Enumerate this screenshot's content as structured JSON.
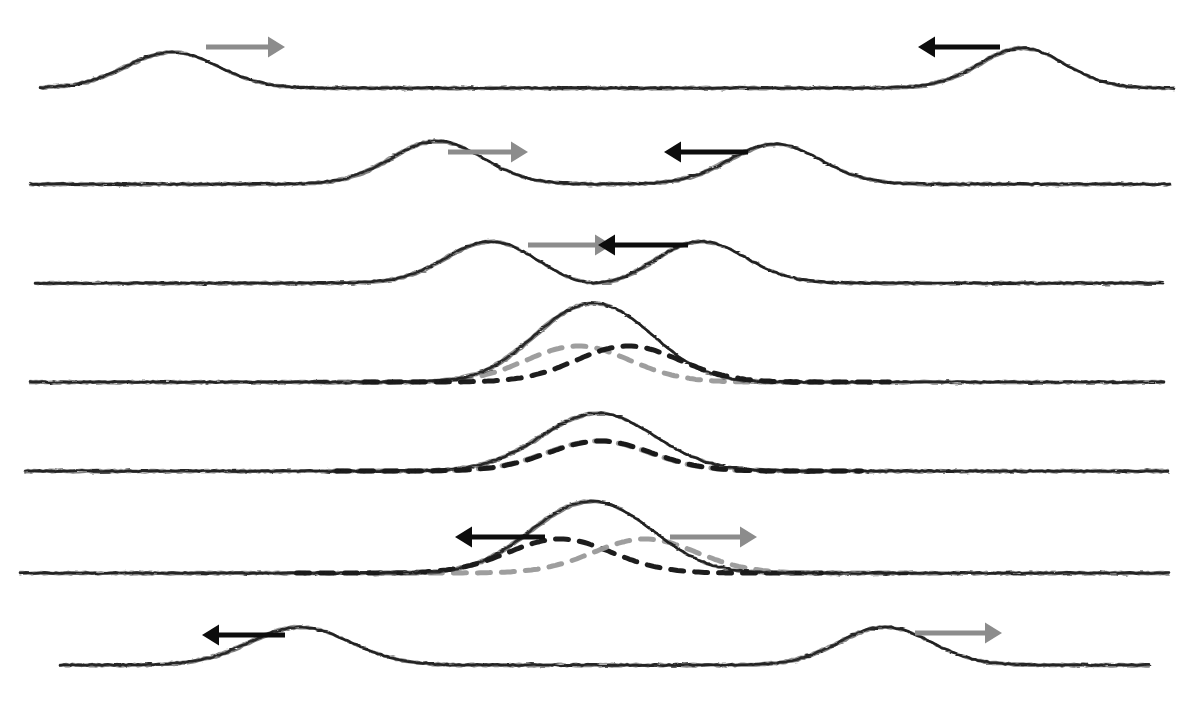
{
  "figure": {
    "title": "Superposition of two wave pulses travelling in opposite directions",
    "subtitle": "",
    "medium": "hand-drawn pencil sketch, photocopied",
    "width": 1191,
    "height": 701,
    "background_color": "#ffffff",
    "rows": 7
  },
  "style": {
    "solid_pulse_color": "#1c1c1c",
    "solid_pulse_width": 2.6,
    "baseline_color": "#2a2a2a",
    "baseline_width": 2.2,
    "dashed_gray_color": "#9a9a9a",
    "dashed_black_color": "#141414",
    "dashed_width": 5.0,
    "dash_pattern": "13 11",
    "arrow_gray_color": "#8c8c8c",
    "arrow_black_color": "#0d0d0d",
    "arrow_shaft_width": 5.0,
    "sketch_jitter": "rough double-stroke"
  },
  "chart_data": {
    "type": "line",
    "title": "Superposition of two wave pulses travelling in opposite directions",
    "subtitle": "",
    "xlabel": "",
    "ylabel": "",
    "xlim": [
      0,
      1191
    ],
    "ylim": [
      0,
      701
    ],
    "grid": false,
    "legend": null,
    "axes_visible": false,
    "panels": [
      {
        "index": 1,
        "label": "pulses far apart, approaching",
        "baseline_y": 88,
        "x_start": 40,
        "x_end": 1175,
        "pulses": [
          {
            "name": "right-moving-pulse",
            "style": "solid",
            "color": "#1c1c1c",
            "center_x": 172,
            "amplitude": 36,
            "width": 150,
            "direction": "right"
          },
          {
            "name": "left-moving-pulse",
            "style": "solid",
            "color": "#1c1c1c",
            "center_x": 1022,
            "amplitude": 40,
            "width": 140,
            "direction": "left"
          }
        ],
        "arrows": [
          {
            "name": "grey-right-arrow",
            "color": "#8c8c8c",
            "direction": "right",
            "x1": 206,
            "x2": 285,
            "y": 47
          },
          {
            "name": "black-left-arrow",
            "color": "#0d0d0d",
            "direction": "left",
            "x1": 1000,
            "x2": 918,
            "y": 47
          }
        ]
      },
      {
        "index": 2,
        "label": "pulses closer together",
        "baseline_y": 184,
        "x_start": 30,
        "x_end": 1170,
        "pulses": [
          {
            "name": "right-moving-pulse",
            "style": "solid",
            "color": "#1c1c1c",
            "center_x": 437,
            "amplitude": 43,
            "width": 150,
            "direction": "right"
          },
          {
            "name": "left-moving-pulse",
            "style": "solid",
            "color": "#1c1c1c",
            "center_x": 775,
            "amplitude": 40,
            "width": 150,
            "direction": "left"
          }
        ],
        "arrows": [
          {
            "name": "grey-right-arrow",
            "color": "#8c8c8c",
            "direction": "right",
            "x1": 448,
            "x2": 528,
            "y": 152
          },
          {
            "name": "black-left-arrow",
            "color": "#0d0d0d",
            "direction": "left",
            "x1": 748,
            "x2": 664,
            "y": 152
          }
        ]
      },
      {
        "index": 3,
        "label": "pulses just touching, small overlap",
        "baseline_y": 283,
        "x_start": 35,
        "x_end": 1165,
        "pulses": [
          {
            "name": "right-moving-pulse",
            "style": "solid",
            "color": "#1c1c1c",
            "center_x": 492,
            "amplitude": 42,
            "width": 150,
            "direction": "right"
          },
          {
            "name": "left-moving-pulse",
            "style": "solid",
            "color": "#1c1c1c",
            "center_x": 700,
            "amplitude": 42,
            "width": 150,
            "direction": "left"
          }
        ],
        "dip": {
          "name": "central-dip",
          "x": 596,
          "depth": 6
        },
        "arrows": [
          {
            "name": "grey-right-arrow",
            "color": "#8c8c8c",
            "direction": "right",
            "x1": 528,
            "x2": 612,
            "y": 245
          },
          {
            "name": "black-left-arrow",
            "color": "#0d0d0d",
            "direction": "left",
            "x1": 688,
            "x2": 598,
            "y": 245
          }
        ]
      },
      {
        "index": 4,
        "label": "partial overlap, constructive build-up",
        "baseline_y": 382,
        "x_start": 30,
        "x_end": 1165,
        "resultant": {
          "name": "resultant-pulse",
          "style": "solid",
          "color": "#1c1c1c",
          "center_x": 592,
          "amplitude": 58,
          "width": 200,
          "notch": true
        },
        "components": [
          {
            "name": "grey-component-pulse",
            "style": "dashed",
            "color": "#9a9a9a",
            "center_x": 578,
            "amplitude": 36,
            "width": 170,
            "direction": "right"
          },
          {
            "name": "black-component-pulse",
            "style": "dashed",
            "color": "#141414",
            "center_x": 628,
            "amplitude": 36,
            "width": 170,
            "direction": "left"
          }
        ],
        "arrows": []
      },
      {
        "index": 5,
        "label": "maximum overlap, pulses coincide",
        "baseline_y": 471,
        "x_start": 25,
        "x_end": 1170,
        "resultant": {
          "name": "resultant-pulse",
          "style": "solid",
          "color": "#1c1c1c",
          "center_x": 598,
          "amplitude": 58,
          "width": 185,
          "notch": false
        },
        "components": [
          {
            "name": "grey-component-pulse",
            "style": "dashed",
            "color": "#9a9a9a",
            "center_x": 598,
            "amplitude": 30,
            "width": 170,
            "direction": "right"
          },
          {
            "name": "black-component-pulse",
            "style": "dashed",
            "color": "#141414",
            "center_x": 600,
            "amplitude": 30,
            "width": 170,
            "direction": "left"
          }
        ],
        "arrows": []
      },
      {
        "index": 6,
        "label": "pulses separating, moving apart",
        "baseline_y": 573,
        "x_start": 20,
        "x_end": 1170,
        "resultant": {
          "name": "resultant-pulse",
          "style": "solid",
          "color": "#1c1c1c",
          "center_x": 590,
          "amplitude": 52,
          "width": 210,
          "notch": true
        },
        "components": [
          {
            "name": "black-component-pulse",
            "style": "dashed",
            "color": "#141414",
            "center_x": 560,
            "amplitude": 34,
            "width": 170,
            "direction": "left"
          },
          {
            "name": "grey-component-pulse",
            "style": "dashed",
            "color": "#9a9a9a",
            "center_x": 645,
            "amplitude": 34,
            "width": 170,
            "direction": "right"
          }
        ],
        "arrows": [
          {
            "name": "black-left-arrow",
            "color": "#0d0d0d",
            "direction": "left",
            "x1": 545,
            "x2": 455,
            "y": 537
          },
          {
            "name": "grey-right-arrow",
            "color": "#8c8c8c",
            "direction": "right",
            "x1": 670,
            "x2": 757,
            "y": 537
          }
        ]
      },
      {
        "index": 7,
        "label": "pulses fully separated, continuing onward",
        "baseline_y": 665,
        "x_start": 60,
        "x_end": 1150,
        "pulses": [
          {
            "name": "left-moving-pulse",
            "style": "solid",
            "color": "#1c1c1c",
            "center_x": 300,
            "amplitude": 38,
            "width": 165,
            "direction": "left"
          },
          {
            "name": "right-moving-pulse",
            "style": "solid",
            "color": "#1c1c1c",
            "center_x": 885,
            "amplitude": 38,
            "width": 150,
            "direction": "right"
          }
        ],
        "arrows": [
          {
            "name": "black-left-arrow",
            "color": "#0d0d0d",
            "direction": "left",
            "x1": 285,
            "x2": 202,
            "y": 635
          },
          {
            "name": "grey-right-arrow",
            "color": "#8c8c8c",
            "direction": "right",
            "x1": 915,
            "x2": 1002,
            "y": 633
          }
        ]
      }
    ]
  }
}
